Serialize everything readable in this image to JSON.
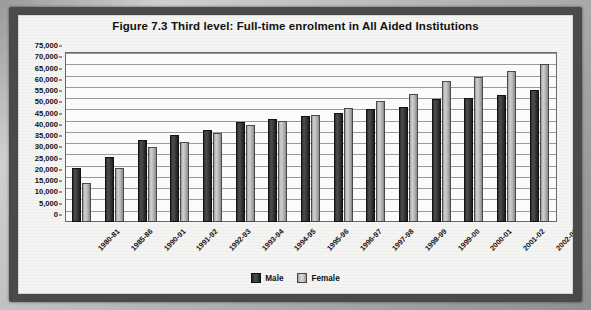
{
  "figure": {
    "label": "Figure 7.3",
    "title": "Third level: Full-time enrolment in All Aided Institutions",
    "full_title": "Figure 7.3   Third level: Full-time enrolment in All Aided Institutions"
  },
  "legend": {
    "male_label": "Male",
    "female_label": "Female",
    "male_color": "#2b2b2b",
    "female_color": "#c6c6c6",
    "position": "bottom-center"
  },
  "axis": {
    "y_ticks": [
      "75,000",
      "70,000",
      "65,000",
      "60,000",
      "55,000",
      "50,000",
      "45,000",
      "40,000",
      "35,000",
      "30,000",
      "25,000",
      "20,000",
      "15,000",
      "10,000",
      "5,000",
      "0"
    ],
    "y_min": 0,
    "y_max": 75000,
    "y_step": 5000,
    "grid": "horizontal"
  },
  "chart_data": {
    "type": "bar",
    "title": "Figure 7.3   Third level: Full-time enrolment in All Aided Institutions",
    "xlabel": "",
    "ylabel": "",
    "ylim": [
      0,
      75000
    ],
    "ytick_step": 5000,
    "grid": true,
    "legend_position": "bottom-center",
    "categories": [
      "1980-81",
      "1985-86",
      "1990-91",
      "1991-92",
      "1992-93",
      "1993-94",
      "1994-95",
      "1995-96",
      "1996-97",
      "1997-98",
      "1998-99",
      "1999-00",
      "2000-01",
      "2001-02",
      "2002-03"
    ],
    "series": [
      {
        "name": "Male",
        "color": "#2b2b2b",
        "values": [
          24000,
          29000,
          36500,
          38500,
          41000,
          44500,
          45500,
          47000,
          48500,
          50000,
          51000,
          54500,
          55000,
          56500,
          58500
        ]
      },
      {
        "name": "Female",
        "color": "#c6c6c6",
        "values": [
          17500,
          24000,
          33500,
          35500,
          39500,
          43000,
          45000,
          47500,
          50500,
          53500,
          57000,
          62500,
          64500,
          67000,
          70000
        ]
      }
    ]
  }
}
